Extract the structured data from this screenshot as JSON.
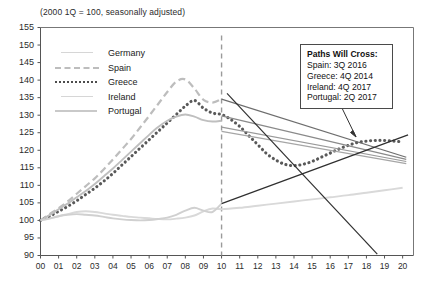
{
  "chart_data": {
    "type": "line",
    "title": "",
    "subtitle": "(2000 1Q = 100, seasonally adjusted)",
    "xlabel": "",
    "ylabel": "",
    "xlim": [
      0,
      20.6
    ],
    "ylim": [
      90,
      155
    ],
    "ytick_step": 5,
    "grid": false,
    "legend_position": "upper-left",
    "x_tick_labels": [
      "00",
      "01",
      "02",
      "03",
      "04",
      "05",
      "06",
      "07",
      "08",
      "09",
      "10",
      "11",
      "12",
      "13",
      "14",
      "15",
      "16",
      "17",
      "18",
      "19",
      "20"
    ],
    "y_tick_labels": [
      "90",
      "95",
      "100",
      "105",
      "110",
      "115",
      "120",
      "125",
      "130",
      "135",
      "140",
      "145",
      "150",
      "155"
    ],
    "forecast_divider_x": 10,
    "forecast_divider_style": "dashed",
    "series": [
      {
        "name": "Germany",
        "color": "#d9d9d9",
        "style": "solid",
        "x": [
          0,
          0.5,
          1,
          1.5,
          2,
          2.5,
          3,
          3.5,
          4,
          4.5,
          5,
          5.5,
          6,
          6.5,
          7,
          7.5,
          8,
          8.5,
          9,
          9.5,
          10,
          11,
          12,
          13,
          14,
          15,
          16,
          17,
          18,
          19,
          20
        ],
        "values": [
          100,
          100.5,
          101.2,
          101.8,
          102.4,
          102.6,
          102.4,
          102,
          101.6,
          101.3,
          101,
          100.8,
          100.6,
          100.4,
          100.3,
          100.5,
          100.8,
          101.4,
          102.6,
          103.4,
          103.2,
          103.6,
          104.2,
          104.8,
          105.4,
          106,
          106.6,
          107.2,
          107.9,
          108.6,
          109.3
        ]
      },
      {
        "name": "Spain",
        "color": "#bdbdbd",
        "style": "dashed",
        "x": [
          0,
          0.5,
          1,
          1.5,
          2,
          2.5,
          3,
          3.5,
          4,
          4.5,
          5,
          5.5,
          6,
          6.5,
          7,
          7.5,
          8,
          8.5,
          9,
          9.5,
          10
        ],
        "values": [
          100,
          101.8,
          103.5,
          105.4,
          107.6,
          109.8,
          112,
          114.6,
          117.4,
          120.3,
          123.2,
          126.5,
          129.8,
          133.2,
          136.6,
          139.6,
          140.2,
          137.6,
          134.4,
          133.6,
          134.6
        ],
        "projection_x": [
          10,
          20
        ],
        "projection_values": [
          134.6,
          118.5
        ]
      },
      {
        "name": "Greece",
        "color": "#595959",
        "style": "dotted",
        "x": [
          0,
          0.5,
          1,
          1.5,
          2,
          2.5,
          3,
          3.5,
          4,
          4.5,
          5,
          5.5,
          6,
          6.5,
          7,
          7.5,
          8,
          8.5,
          9,
          9.5,
          10,
          10.5,
          11,
          11.5,
          12,
          12.5,
          13,
          13.5,
          14,
          14.5,
          15,
          15.5,
          16,
          16.5,
          17,
          17.5,
          18,
          18.5,
          19,
          19.5,
          20
        ],
        "values": [
          100,
          101.2,
          102.6,
          104,
          105.6,
          107.4,
          109.2,
          111.2,
          113.4,
          115.8,
          118.2,
          120.6,
          123,
          125.4,
          127.8,
          130.2,
          132.6,
          134.2,
          132,
          130.6,
          130.2,
          128.8,
          126.8,
          124.2,
          121.6,
          119,
          117.2,
          116,
          115.6,
          116,
          116.8,
          118,
          119.2,
          120.4,
          121.4,
          122.2,
          122.6,
          122.8,
          122.8,
          122.6,
          122.4
        ]
      },
      {
        "name": "Ireland",
        "color": "#bfbfbf",
        "style": "solid",
        "x": [
          0,
          0.5,
          1,
          1.5,
          2,
          2.5,
          3,
          3.5,
          4,
          4.5,
          5,
          5.5,
          6,
          6.5,
          7,
          7.5,
          8,
          8.5,
          9,
          9.5,
          10
        ],
        "values": [
          100,
          101.5,
          103.2,
          104.8,
          106.6,
          108.4,
          110.4,
          112.6,
          114.8,
          117.2,
          119.6,
          122,
          124.4,
          126.6,
          128.4,
          129.6,
          130.2,
          129.6,
          128.6,
          128.2,
          128.4
        ],
        "projection_x": [
          10,
          20
        ],
        "projection_values": [
          128.4,
          113.5
        ]
      },
      {
        "name": "Portugal",
        "color": "#d0d0d0",
        "style": "solid",
        "x": [
          0,
          0.5,
          1,
          1.5,
          2,
          2.5,
          3,
          3.5,
          4,
          4.5,
          5,
          5.5,
          6,
          6.5,
          7,
          7.5,
          8,
          8.5,
          9,
          9.5,
          10
        ],
        "values": [
          100,
          100.6,
          101.2,
          101.6,
          101.8,
          101.6,
          101.4,
          101,
          100.6,
          100.3,
          100.1,
          100,
          100.1,
          100.4,
          100.8,
          101.6,
          102.8,
          103.6,
          102.8,
          102.4,
          104.8
        ],
        "projection_x": [
          10,
          20
        ],
        "projection_values": [
          104.8,
          124.2
        ]
      }
    ],
    "projection_lines": [
      {
        "name": "spain-projection",
        "color": "#6e6e6e",
        "x0": 10,
        "y0": 134.6,
        "x1": 20.2,
        "y1": 118.0
      },
      {
        "name": "greece-projection",
        "color": "#8a8a8a",
        "x0": 10,
        "y0": 129.8,
        "x1": 20.2,
        "y1": 117.4
      },
      {
        "name": "ireland-projection",
        "color": "#9a9a9a",
        "x0": 10,
        "y0": 126.6,
        "x1": 20.2,
        "y1": 116.8
      },
      {
        "name": "ireland-projection-2",
        "color": "#a6a6a6",
        "x0": 10,
        "y0": 125.4,
        "x1": 20.2,
        "y1": 116.2
      },
      {
        "name": "portugal-projection-up",
        "color": "#2f2f2f",
        "x0": 10,
        "y0": 104.8,
        "x1": 20.3,
        "y1": 124.4
      },
      {
        "name": "portugal-projection-down",
        "color": "#2f2f2f",
        "x0": 10.3,
        "y0": 136.2,
        "x1": 18.6,
        "y1": 90.4
      }
    ]
  },
  "legend": {
    "items": [
      {
        "label": "Germany",
        "swatch": "thin-solid"
      },
      {
        "label": "Spain",
        "swatch": "long-dash"
      },
      {
        "label": "Greece",
        "swatch": "dotted"
      },
      {
        "label": "Ireland",
        "swatch": "thin-solid"
      },
      {
        "label": "Portugal",
        "swatch": "thick-solid"
      }
    ]
  },
  "callout": {
    "title": "Paths Will Cross:",
    "lines": [
      "Spain: 3Q 2016",
      "Greece: 4Q 2014",
      "Ireland: 4Q 2017",
      "Portugal: 2Q 2017"
    ]
  }
}
